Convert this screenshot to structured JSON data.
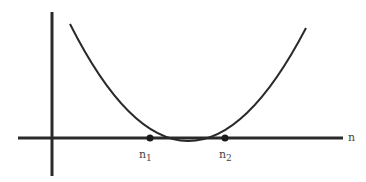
{
  "diagram": {
    "axis_label_x": "n",
    "root1": {
      "base": "n",
      "sub": "1"
    },
    "root2": {
      "base": "n",
      "sub": "2"
    },
    "colors": {
      "stroke": "#2a2a2a",
      "label": "#444444"
    }
  }
}
